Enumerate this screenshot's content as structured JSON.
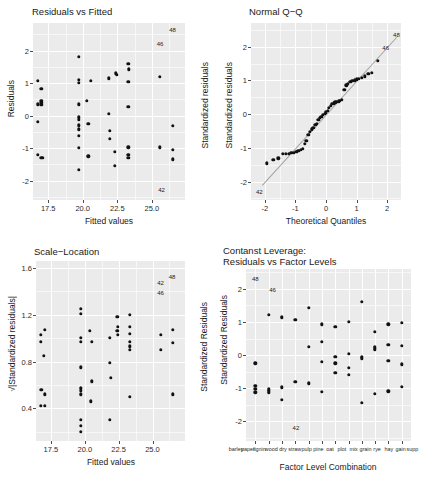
{
  "figure": {
    "background": "#ffffff",
    "panel_background": "#ebebeb",
    "grid_color": "#ffffff",
    "point_color": "#111111",
    "width": 431,
    "height": 485
  },
  "chart_data": [
    {
      "type": "scatter",
      "id": "residuals-vs-fitted",
      "title": "Residuals vs Fitted",
      "xlabel": "Fitted values",
      "ylabel": "Residuals",
      "xlim": [
        16.4,
        27.4
      ],
      "ylim": [
        -2.6,
        2.85
      ],
      "xticks": [
        "17.5",
        "20.0",
        "22.5",
        "25.0"
      ],
      "xtickvals": [
        17.5,
        20.0,
        22.5,
        25.0
      ],
      "yticks": [
        "2",
        "1",
        "0",
        "-1",
        "-2"
      ],
      "ytickvals": [
        2,
        1,
        0,
        -1,
        -2
      ],
      "grid": true,
      "points": [
        [
          16.77,
          1.07
        ],
        [
          17.0,
          0.82
        ],
        [
          16.77,
          0.35
        ],
        [
          17.0,
          0.45
        ],
        [
          17.0,
          0.4
        ],
        [
          17.0,
          0.33
        ],
        [
          16.77,
          -0.2
        ],
        [
          16.77,
          -1.2
        ],
        [
          17.0,
          -1.3
        ],
        [
          17.1,
          -1.3
        ],
        [
          19.7,
          1.82
        ],
        [
          19.7,
          1.1
        ],
        [
          19.7,
          1.0
        ],
        [
          20.6,
          1.07
        ],
        [
          19.7,
          0.35
        ],
        [
          20.3,
          0.45
        ],
        [
          19.7,
          -0.05
        ],
        [
          19.72,
          -0.12
        ],
        [
          19.7,
          -0.3
        ],
        [
          19.7,
          -0.42
        ],
        [
          20.4,
          -0.25
        ],
        [
          19.7,
          -0.62
        ],
        [
          19.7,
          -1.0
        ],
        [
          20.4,
          -1.25
        ],
        [
          19.7,
          -1.68
        ],
        [
          21.9,
          1.15
        ],
        [
          22.4,
          1.3
        ],
        [
          22.45,
          1.25
        ],
        [
          23.3,
          1.6
        ],
        [
          23.35,
          1.42
        ],
        [
          23.3,
          1.05
        ],
        [
          21.9,
          0.05
        ],
        [
          23.3,
          0.28
        ],
        [
          21.95,
          -0.48
        ],
        [
          21.95,
          -0.72
        ],
        [
          22.3,
          -1.12
        ],
        [
          23.3,
          -0.98
        ],
        [
          23.3,
          -1.2
        ],
        [
          23.3,
          -1.3
        ],
        [
          22.3,
          -1.55
        ],
        [
          25.6,
          1.2
        ],
        [
          26.5,
          -0.32
        ],
        [
          25.6,
          -0.98
        ],
        [
          26.5,
          -1.05
        ],
        [
          26.5,
          -1.35
        ]
      ],
      "outlier_labels": [
        {
          "x": 26.5,
          "y": 2.65,
          "text": "48"
        },
        {
          "x": 25.6,
          "y": 2.2,
          "text": "46"
        },
        {
          "x": 25.7,
          "y": -2.3,
          "text": "42"
        }
      ],
      "right_axis_label": "Standardized residuals"
    },
    {
      "type": "scatter",
      "id": "normal-qq",
      "title": "Normal Q−Q",
      "xlabel": "Theoretical Quantiles",
      "ylabel": "Standardized residuals",
      "xlim": [
        -2.45,
        2.45
      ],
      "ylim": [
        -2.55,
        2.7
      ],
      "xticks": [
        "-2",
        "-1",
        "0",
        "1",
        "2"
      ],
      "xtickvals": [
        -2,
        -1,
        0,
        1,
        2
      ],
      "yticks": [
        "2",
        "1",
        "0",
        "-1",
        "-2"
      ],
      "ytickvals": [
        2,
        1,
        0,
        -1,
        -2
      ],
      "grid": true,
      "reference_line": true,
      "points": [
        [
          -1.93,
          -1.46
        ],
        [
          -1.72,
          -1.35
        ],
        [
          -1.56,
          -1.31
        ],
        [
          -1.42,
          -1.19
        ],
        [
          -1.32,
          -1.18
        ],
        [
          -1.22,
          -1.17
        ],
        [
          -1.13,
          -1.16
        ],
        [
          -1.05,
          -1.14
        ],
        [
          -0.97,
          -1.12
        ],
        [
          -0.9,
          -1.1
        ],
        [
          -0.83,
          -1.06
        ],
        [
          -0.76,
          -1.03
        ],
        [
          -0.7,
          -0.88
        ],
        [
          -0.64,
          -0.8
        ],
        [
          -0.58,
          -0.62
        ],
        [
          -0.52,
          -0.52
        ],
        [
          -0.46,
          -0.45
        ],
        [
          -0.41,
          -0.4
        ],
        [
          -0.35,
          -0.32
        ],
        [
          -0.3,
          -0.28
        ],
        [
          -0.25,
          -0.18
        ],
        [
          -0.2,
          -0.12
        ],
        [
          -0.15,
          -0.08
        ],
        [
          -0.1,
          -0.03
        ],
        [
          -0.05,
          0.0
        ],
        [
          0.0,
          0.05
        ],
        [
          0.05,
          0.1
        ],
        [
          0.1,
          0.18
        ],
        [
          0.15,
          0.25
        ],
        [
          0.2,
          0.3
        ],
        [
          0.25,
          0.32
        ],
        [
          0.3,
          0.35
        ],
        [
          0.35,
          0.36
        ],
        [
          0.41,
          0.38
        ],
        [
          0.46,
          0.4
        ],
        [
          0.52,
          0.42
        ],
        [
          0.6,
          0.72
        ],
        [
          0.66,
          0.85
        ],
        [
          0.72,
          0.9
        ],
        [
          0.79,
          0.95
        ],
        [
          0.86,
          0.98
        ],
        [
          0.93,
          1.0
        ],
        [
          1.0,
          1.03
        ],
        [
          1.08,
          1.05
        ],
        [
          1.17,
          1.08
        ],
        [
          1.27,
          1.12
        ],
        [
          1.38,
          1.2
        ],
        [
          1.5,
          1.22
        ],
        [
          1.7,
          1.58
        ]
      ],
      "outlier_labels": [
        {
          "x": 2.3,
          "y": 2.35,
          "text": "48"
        },
        {
          "x": 1.95,
          "y": 1.95,
          "text": "46"
        },
        {
          "x": -2.18,
          "y": -2.3,
          "text": "42"
        }
      ]
    },
    {
      "type": "scatter",
      "id": "scale-location",
      "title": "Scale−Location",
      "xlabel": "Fitted values",
      "ylabel": "√|Standardized residuals|",
      "xlim": [
        16.4,
        27.4
      ],
      "ylim": [
        0.12,
        1.66
      ],
      "xticks": [
        "17.5",
        "20.0",
        "22.5",
        "25.0"
      ],
      "xtickvals": [
        17.5,
        20.0,
        22.5,
        25.0
      ],
      "yticks": [
        "1.6",
        "1.2",
        "0.8",
        "0.4"
      ],
      "ytickvals": [
        1.6,
        1.2,
        0.8,
        0.4
      ],
      "grid": true,
      "points": [
        [
          16.77,
          1.03
        ],
        [
          16.77,
          0.97
        ],
        [
          17.05,
          1.07
        ],
        [
          16.95,
          0.85
        ],
        [
          16.8,
          0.56
        ],
        [
          17.05,
          0.52
        ],
        [
          16.75,
          0.42
        ],
        [
          17.05,
          0.42
        ],
        [
          19.7,
          1.25
        ],
        [
          19.7,
          1.21
        ],
        [
          19.7,
          1.0
        ],
        [
          19.7,
          0.97
        ],
        [
          20.35,
          1.06
        ],
        [
          20.5,
          0.97
        ],
        [
          19.72,
          0.75
        ],
        [
          19.7,
          0.57
        ],
        [
          19.7,
          0.55
        ],
        [
          19.7,
          0.52
        ],
        [
          20.45,
          0.46
        ],
        [
          20.5,
          0.63
        ],
        [
          19.7,
          0.3
        ],
        [
          19.7,
          0.25
        ],
        [
          19.7,
          0.2
        ],
        [
          21.85,
          0.3
        ],
        [
          22.4,
          1.18
        ],
        [
          22.42,
          1.1
        ],
        [
          22.4,
          1.06
        ],
        [
          22.45,
          1.03
        ],
        [
          21.85,
          1.0
        ],
        [
          23.3,
          1.2
        ],
        [
          23.3,
          1.1
        ],
        [
          23.3,
          1.04
        ],
        [
          23.3,
          0.97
        ],
        [
          23.3,
          0.93
        ],
        [
          23.3,
          0.9
        ],
        [
          21.85,
          0.79
        ],
        [
          21.9,
          0.66
        ],
        [
          23.35,
          0.5
        ],
        [
          25.6,
          1.03
        ],
        [
          26.5,
          1.07
        ],
        [
          26.5,
          0.96
        ],
        [
          25.6,
          0.9
        ],
        [
          26.5,
          0.52
        ]
      ],
      "outlier_labels": [
        {
          "x": 26.45,
          "y": 1.52,
          "text": "48"
        },
        {
          "x": 25.6,
          "y": 1.47,
          "text": "42"
        },
        {
          "x": 25.6,
          "y": 1.39,
          "text": "46"
        }
      ],
      "right_axis_label": "Standardized Residuals"
    },
    {
      "type": "scatter",
      "id": "constant-leverage",
      "title": "Contanst Leverage:\nResiduals vs Factor Levels",
      "xlabel": "Factor Level Combination",
      "ylabel": "Standardized Residuals",
      "xlim": [
        0.3,
        12.7
      ],
      "ylim": [
        -2.6,
        2.6
      ],
      "yticks": [
        "2",
        "1",
        "0",
        "-1",
        "-2"
      ],
      "ytickvals": [
        2,
        1,
        0,
        -1,
        -2
      ],
      "grid": true,
      "category_labels": [
        "barley",
        "paper",
        "lignin",
        "wood",
        "dry",
        "straw",
        "pulp",
        "pine",
        "oat",
        "plot",
        "mix",
        "grain",
        "rye",
        "hay",
        "gain",
        "supp"
      ],
      "xtickvals": [
        1,
        2,
        3,
        4,
        5,
        6,
        7,
        8,
        9,
        10,
        11,
        12
      ],
      "grid_vertical": true,
      "points": [
        [
          1,
          -0.25
        ],
        [
          1,
          -0.93
        ],
        [
          1,
          -1.02
        ],
        [
          1,
          -1.13
        ],
        [
          2,
          1.22
        ],
        [
          2,
          -1.04
        ],
        [
          2,
          -1.1
        ],
        [
          2,
          -1.15
        ],
        [
          3,
          1.15
        ],
        [
          3,
          1.12
        ],
        [
          3,
          -0.98
        ],
        [
          3,
          -1.35
        ],
        [
          4,
          1.07
        ],
        [
          4,
          -0.82
        ],
        [
          5,
          1.43
        ],
        [
          5,
          0.25
        ],
        [
          5,
          -0.85
        ],
        [
          5,
          -0.88
        ],
        [
          6,
          0.93
        ],
        [
          6,
          0.4
        ],
        [
          6,
          -0.2
        ],
        [
          6,
          -1.12
        ],
        [
          7,
          0.86
        ],
        [
          7,
          -0.05
        ],
        [
          7,
          -0.25
        ],
        [
          7,
          -0.54
        ],
        [
          8,
          1.0
        ],
        [
          8,
          0.03
        ],
        [
          8,
          -0.38
        ],
        [
          8,
          -0.6
        ],
        [
          9,
          1.6
        ],
        [
          9,
          -0.06
        ],
        [
          9,
          -0.1
        ],
        [
          9,
          -1.45
        ],
        [
          10,
          0.71
        ],
        [
          10,
          0.25
        ],
        [
          10,
          0.2
        ],
        [
          10,
          0.15
        ],
        [
          10,
          -1.17
        ],
        [
          11,
          0.93
        ],
        [
          11,
          0.3
        ],
        [
          11,
          -0.17
        ],
        [
          11,
          -1.1
        ],
        [
          12,
          0.97
        ],
        [
          12,
          0.28
        ],
        [
          12,
          -0.28
        ],
        [
          12,
          -0.97
        ]
      ],
      "outlier_labels": [
        {
          "x": 1.0,
          "y": 2.3,
          "text": "48"
        },
        {
          "x": 2.3,
          "y": 1.98,
          "text": "46"
        },
        {
          "x": 4.05,
          "y": -2.22,
          "text": "42"
        }
      ]
    }
  ]
}
